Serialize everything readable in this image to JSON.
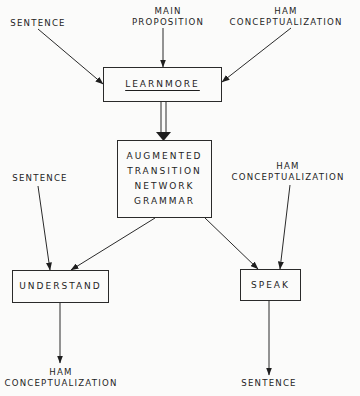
{
  "inputs_top": {
    "sentence": "SENTENCE",
    "main_proposition": [
      "MAIN",
      "PROPOSITION"
    ],
    "ham_conceptualization": [
      "HAM",
      "CONCEPTUALIZATION"
    ]
  },
  "nodes": {
    "learnmore": "LEARNMORE",
    "atn": [
      "AUGMENTED",
      "TRANSITION",
      "NETWORK",
      "GRAMMAR"
    ],
    "understand": "UNDERSTAND",
    "speak": "SPEAK"
  },
  "inputs_middle": {
    "sentence": "SENTENCE",
    "ham_conceptualization": [
      "HAM",
      "CONCEPTUALIZATION"
    ]
  },
  "outputs": {
    "understand_output": [
      "HAM",
      "CONCEPTUALIZATION"
    ],
    "speak_output": "SENTENCE"
  },
  "edges": [
    {
      "from": "SENTENCE",
      "to": "LEARNMORE"
    },
    {
      "from": "MAIN PROPOSITION",
      "to": "LEARNMORE"
    },
    {
      "from": "HAM CONCEPTUALIZATION",
      "to": "LEARNMORE"
    },
    {
      "from": "LEARNMORE",
      "to": "AUGMENTED TRANSITION NETWORK GRAMMAR",
      "style": "double"
    },
    {
      "from": "AUGMENTED TRANSITION NETWORK GRAMMAR",
      "to": "UNDERSTAND"
    },
    {
      "from": "AUGMENTED TRANSITION NETWORK GRAMMAR",
      "to": "SPEAK"
    },
    {
      "from": "SENTENCE",
      "to": "UNDERSTAND"
    },
    {
      "from": "HAM CONCEPTUALIZATION",
      "to": "SPEAK"
    },
    {
      "from": "UNDERSTAND",
      "to": "HAM CONCEPTUALIZATION"
    },
    {
      "from": "SPEAK",
      "to": "SENTENCE"
    }
  ]
}
